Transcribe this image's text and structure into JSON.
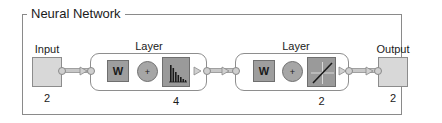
{
  "diagram": {
    "title": "Neural Network",
    "input": {
      "label": "Input",
      "size": "2"
    },
    "layers": [
      {
        "label": "Layer",
        "weight_label": "W",
        "sum_label": "+",
        "transfer": "hist-transfer",
        "size": "4"
      },
      {
        "label": "Layer",
        "weight_label": "W",
        "sum_label": "+",
        "transfer": "linear-transfer",
        "size": "2"
      }
    ],
    "output": {
      "label": "Output",
      "size": "2"
    }
  },
  "colors": {
    "box_fill": "#d8d8d8",
    "block_fill": "#9e9e9e",
    "border": "#8a8a8a"
  }
}
